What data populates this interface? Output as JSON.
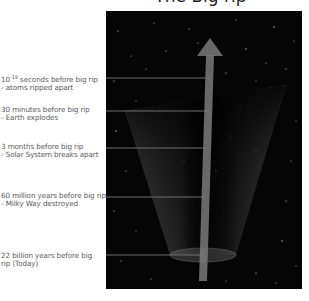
{
  "title": "The Big rip",
  "colors": {
    "background": "#ffffff",
    "panel": "#050506",
    "cone": "#8a8a8a",
    "arrow": "#7a7a7a",
    "lines": "#6f6f6f",
    "label_text": "#5a5a5a"
  },
  "events": [
    {
      "time_prefix": "10",
      "time_exponent": "-19",
      "time_suffix": "seconds before big rip",
      "description": "- atoms ripped apart"
    },
    {
      "time": "30 minutes before big rip",
      "description": "- Earth explodes"
    },
    {
      "time": "3 months before big rip",
      "description": "- Solar System breaks apart"
    },
    {
      "time": "60 million years before big rip",
      "description": "- Milky Way destroyed"
    },
    {
      "time": "22 billion years before big",
      "description": "rip (Today)"
    }
  ]
}
